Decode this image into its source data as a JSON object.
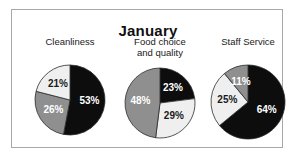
{
  "chart_data": {
    "type": "pie",
    "title": "January",
    "xlabel": "",
    "ylabel": "",
    "legend_position": "none",
    "grid": false,
    "charts": [
      {
        "title": "Cleanliness",
        "categories": [
          "Very good",
          "Satisfactory",
          "Poor"
        ],
        "values": [
          53,
          26,
          21
        ],
        "labels": [
          "53%",
          "26%",
          "21%"
        ],
        "colors": [
          "#0d0d0d",
          "#8f8f8f",
          "#efefef"
        ],
        "label_colors": [
          "#ffffff",
          "#ffffff",
          "#1a1a1a"
        ]
      },
      {
        "title_line1": "Food choice",
        "title_line2": "and quality",
        "title": "Food choice and quality",
        "categories": [
          "Very good",
          "Satisfactory",
          "Poor"
        ],
        "values": [
          23,
          29,
          48
        ],
        "labels": [
          "23%",
          "29%",
          "48%"
        ],
        "colors": [
          "#0d0d0d",
          "#efefef",
          "#8f8f8f"
        ],
        "label_colors": [
          "#ffffff",
          "#1a1a1a",
          "#ffffff"
        ]
      },
      {
        "title": "Staff Service",
        "categories": [
          "Very good",
          "Satisfactory",
          "Poor"
        ],
        "values": [
          64,
          25,
          11
        ],
        "labels": [
          "64%",
          "25%",
          "11%"
        ],
        "colors": [
          "#0d0d0d",
          "#efefef",
          "#8f8f8f"
        ],
        "label_colors": [
          "#ffffff",
          "#1a1a1a",
          "#ffffff"
        ]
      }
    ]
  },
  "figure": {
    "title": "January",
    "border_color": "#a8a8a8",
    "background": "#ffffff"
  }
}
